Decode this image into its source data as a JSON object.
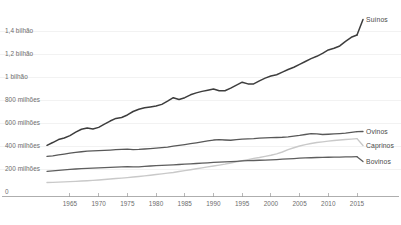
{
  "chart_data": {
    "type": "line",
    "title": "",
    "xlabel": "",
    "ylabel": "",
    "xlim": [
      1961,
      2015
    ],
    "ylim": [
      0,
      1450000000
    ],
    "grid": true,
    "legend_position": "right-inline",
    "x_ticks": [
      1965,
      1970,
      1975,
      1980,
      1985,
      1990,
      1995,
      2000,
      2005,
      2010,
      2015
    ],
    "y_ticks": [
      0,
      200000000,
      400000000,
      600000000,
      800000000,
      1000000000,
      1200000000,
      1400000000
    ],
    "y_tick_labels": [
      "0",
      "200 milhões",
      "400 milhões",
      "600 milhões",
      "800 milhões",
      "1 bilhão",
      "1,2 bilhão",
      "1,4 bilhão"
    ],
    "x": [
      1961,
      1962,
      1963,
      1964,
      1965,
      1966,
      1967,
      1968,
      1969,
      1970,
      1971,
      1972,
      1973,
      1974,
      1975,
      1976,
      1977,
      1978,
      1979,
      1980,
      1981,
      1982,
      1983,
      1984,
      1985,
      1986,
      1987,
      1988,
      1989,
      1990,
      1991,
      1992,
      1993,
      1994,
      1995,
      1996,
      1997,
      1998,
      1999,
      2000,
      2001,
      2002,
      2003,
      2004,
      2005,
      2006,
      2007,
      2008,
      2009,
      2010,
      2011,
      2012,
      2013,
      2014,
      2015
    ],
    "series": [
      {
        "name": "Suínos",
        "color": "#3d3d3d",
        "label_color": "#4a4a4a",
        "width": 1.5,
        "values": [
          406000000,
          430000000,
          456000000,
          470000000,
          490000000,
          520000000,
          546000000,
          556000000,
          548000000,
          562000000,
          590000000,
          617000000,
          640000000,
          648000000,
          670000000,
          700000000,
          720000000,
          733000000,
          740000000,
          748000000,
          762000000,
          790000000,
          820000000,
          805000000,
          820000000,
          845000000,
          862000000,
          875000000,
          885000000,
          895000000,
          880000000,
          880000000,
          903000000,
          930000000,
          955000000,
          940000000,
          940000000,
          966000000,
          990000000,
          1008000000,
          1020000000,
          1042000000,
          1065000000,
          1085000000,
          1110000000,
          1135000000,
          1160000000,
          1180000000,
          1205000000,
          1235000000,
          1250000000,
          1270000000,
          1310000000,
          1345000000,
          1365000000
        ]
      },
      {
        "name": "Ovinos",
        "color": "#585858",
        "label_color": "#4a4a4a",
        "width": 1.3,
        "values": [
          310000000,
          315000000,
          322000000,
          330000000,
          338000000,
          345000000,
          350000000,
          355000000,
          358000000,
          360000000,
          362000000,
          365000000,
          368000000,
          370000000,
          372000000,
          368000000,
          370000000,
          374000000,
          378000000,
          382000000,
          386000000,
          390000000,
          398000000,
          405000000,
          412000000,
          420000000,
          428000000,
          436000000,
          444000000,
          452000000,
          455000000,
          452000000,
          450000000,
          455000000,
          460000000,
          462000000,
          464000000,
          468000000,
          470000000,
          472000000,
          474000000,
          476000000,
          480000000,
          486000000,
          492000000,
          500000000,
          508000000,
          505000000,
          500000000,
          502000000,
          505000000,
          508000000,
          512000000,
          518000000,
          525000000
        ]
      },
      {
        "name": "Caprinos",
        "color": "#c9c9c9",
        "label_color": "#4a4a4a",
        "width": 1.4,
        "values": [
          82000000,
          84000000,
          86000000,
          88000000,
          90000000,
          92000000,
          95000000,
          98000000,
          101000000,
          105000000,
          109000000,
          113000000,
          117000000,
          121000000,
          125000000,
          130000000,
          135000000,
          140000000,
          146000000,
          152000000,
          158000000,
          164000000,
          170000000,
          178000000,
          186000000,
          194000000,
          202000000,
          210000000,
          218000000,
          226000000,
          234000000,
          242000000,
          252000000,
          262000000,
          272000000,
          282000000,
          292000000,
          300000000,
          310000000,
          320000000,
          332000000,
          348000000,
          368000000,
          385000000,
          400000000,
          412000000,
          422000000,
          430000000,
          436000000,
          442000000,
          448000000,
          452000000,
          456000000,
          460000000,
          464000000
        ]
      },
      {
        "name": "Bovinos",
        "color": "#5e5e5e",
        "label_color": "#4a4a4a",
        "width": 1.3,
        "values": [
          180000000,
          184000000,
          188000000,
          192000000,
          196000000,
          200000000,
          203000000,
          206000000,
          208000000,
          210000000,
          212000000,
          214000000,
          216000000,
          218000000,
          220000000,
          218000000,
          219000000,
          222000000,
          226000000,
          230000000,
          232000000,
          234000000,
          236000000,
          239000000,
          242000000,
          245000000,
          248000000,
          251000000,
          254000000,
          257000000,
          260000000,
          262000000,
          264000000,
          267000000,
          270000000,
          272000000,
          274000000,
          276000000,
          278000000,
          280000000,
          282000000,
          285000000,
          288000000,
          291000000,
          294000000,
          296000000,
          298000000,
          300000000,
          301000000,
          302000000,
          303000000,
          304000000,
          305000000,
          306000000,
          307000000
        ]
      }
    ]
  },
  "axis": {
    "x_tick_labels": [
      "1965",
      "1970",
      "1975",
      "1980",
      "1985",
      "1990",
      "1995",
      "2000",
      "2005",
      "2010",
      "2015"
    ],
    "y_tick_labels": [
      "1,4 bilhão",
      "1,2 bilhão",
      "1 bilhão",
      "800 milhões",
      "600 milhões",
      "400 milhões",
      "200 milhões",
      "0"
    ]
  },
  "series_labels": [
    "Suínos",
    "Ovinos",
    "Caprinos",
    "Bovinos"
  ],
  "colors": {
    "suinos": "#3d3d3d",
    "ovinos": "#585858",
    "caprinos": "#c9c9c9",
    "bovinos": "#5e5e5e",
    "grid": "#ededed",
    "axis": "#9a9a9a",
    "tick_text": "#6d6d6d",
    "label_text": "#4a4a4a",
    "background": "#ffffff"
  }
}
